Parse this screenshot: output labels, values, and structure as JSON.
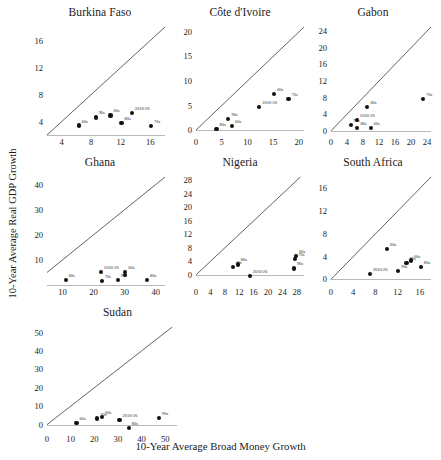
{
  "figure": {
    "ylabel": "10-Year Average Real GDP Growth",
    "xlabel": "10-Year Average Broad Money Growth",
    "point_color": "#111111",
    "line_color": "#3a3a3a",
    "background": "#ffffff"
  },
  "chart_data": {
    "type": "scatter",
    "title": "",
    "xlabel": "10-Year Average Broad Money Growth",
    "ylabel": "10-Year Average Real GDP Growth",
    "grid": false,
    "legend": false,
    "note": "Seven small-multiple scatter panels; each point is a decade. Diagonal reference line is the 45-degree line y = x.",
    "panels": [
      {
        "name": "Burkina Faso",
        "xlim": [
          2,
          18
        ],
        "ylim": [
          2,
          18
        ],
        "xticks": [
          4,
          8,
          12,
          16
        ],
        "yticks": [
          4,
          8,
          12,
          16
        ],
        "reference_line": "45-degree",
        "points": [
          {
            "label": "60s",
            "x": 6.3,
            "y": 3.4
          },
          {
            "label": "90s",
            "x": 8.6,
            "y": 4.6
          },
          {
            "label": "00s",
            "x": 10.6,
            "y": 4.9
          },
          {
            "label": "80s",
            "x": 12.1,
            "y": 3.8
          },
          {
            "label": "2010-20",
            "x": 13.5,
            "y": 5.2
          },
          {
            "label": "70s",
            "x": 16.1,
            "y": 3.3
          }
        ]
      },
      {
        "name": "Côte d'Ivoire",
        "xlim": [
          0,
          21
        ],
        "ylim": [
          -1,
          21
        ],
        "xticks": [
          0,
          5,
          10,
          15,
          20
        ],
        "yticks": [
          0,
          5,
          10,
          15,
          20
        ],
        "reference_line": "45-degree",
        "points": [
          {
            "label": "80s",
            "x": 4.0,
            "y": 0.2
          },
          {
            "label": "90s",
            "x": 6.3,
            "y": 2.3
          },
          {
            "label": "00s",
            "x": 7.0,
            "y": 0.8
          },
          {
            "label": "2010-20",
            "x": 12.3,
            "y": 4.7
          },
          {
            "label": "60s",
            "x": 15.2,
            "y": 7.4
          },
          {
            "label": "70s",
            "x": 18.0,
            "y": 6.3
          }
        ]
      },
      {
        "name": "Gabon",
        "xlim": [
          0,
          25
        ],
        "ylim": [
          -1,
          25
        ],
        "xticks": [
          0,
          4,
          8,
          12,
          16,
          20,
          24
        ],
        "yticks": [
          0,
          4,
          8,
          12,
          16,
          20,
          24
        ],
        "reference_line": "45-degree",
        "points": [
          {
            "label": "90s",
            "x": 4.9,
            "y": 1.4
          },
          {
            "label": "2010-20",
            "x": 6.5,
            "y": 2.7
          },
          {
            "label": "80s",
            "x": 6.6,
            "y": 0.7
          },
          {
            "label": "00s",
            "x": 9.9,
            "y": 0.6
          },
          {
            "label": "60s",
            "x": 9.1,
            "y": 5.8
          },
          {
            "label": "70s",
            "x": 23.0,
            "y": 7.7
          }
        ]
      },
      {
        "name": "Ghana",
        "xlim": [
          5,
          43
        ],
        "ylim": [
          0,
          43
        ],
        "xticks": [
          10,
          20,
          30,
          40
        ],
        "yticks": [
          10,
          20,
          30,
          40
        ],
        "reference_line": "45-degree",
        "points": [
          {
            "label": "60s",
            "x": 11.0,
            "y": 2.0
          },
          {
            "label": "70s",
            "x": 22.6,
            "y": 1.7
          },
          {
            "label": "2010-20",
            "x": 22.4,
            "y": 5.2
          },
          {
            "label": "90s",
            "x": 27.8,
            "y": 1.9
          },
          {
            "label": "00s",
            "x": 30.2,
            "y": 5.1
          },
          {
            "label": "00s-b",
            "x": 30.2,
            "y": 4.0
          },
          {
            "label": "80s",
            "x": 37.2,
            "y": 2.0
          }
        ]
      },
      {
        "name": "Nigeria",
        "xlim": [
          0,
          30
        ],
        "ylim": [
          -3,
          29
        ],
        "xticks": [
          0,
          4,
          8,
          12,
          16,
          20,
          24,
          28
        ],
        "yticks": [
          0,
          4,
          8,
          12,
          16,
          20,
          24,
          28
        ],
        "reference_line": "45-degree",
        "points": [
          {
            "label": "40s",
            "x": 10.2,
            "y": 2.4
          },
          {
            "label": "80s",
            "x": 11.6,
            "y": 3.1
          },
          {
            "label": "2010-20",
            "x": 14.9,
            "y": -0.4
          },
          {
            "label": "90s",
            "x": 27.2,
            "y": 1.9
          },
          {
            "label": "70s",
            "x": 27.6,
            "y": 4.6
          },
          {
            "label": "00s",
            "x": 27.8,
            "y": 5.6
          }
        ]
      },
      {
        "name": "South Africa",
        "xlim": [
          0,
          18
        ],
        "ylim": [
          -1,
          18
        ],
        "xticks": [
          0,
          4,
          8,
          12,
          16
        ],
        "yticks": [
          0,
          4,
          8,
          12,
          16
        ],
        "reference_line": "45-degree",
        "points": [
          {
            "label": "2010-20",
            "x": 7.0,
            "y": 1.0
          },
          {
            "label": "60s",
            "x": 10.1,
            "y": 5.4
          },
          {
            "label": "90s",
            "x": 12.1,
            "y": 1.4
          },
          {
            "label": "70s",
            "x": 13.6,
            "y": 2.9
          },
          {
            "label": "00s",
            "x": 14.4,
            "y": 3.3
          },
          {
            "label": "80s",
            "x": 16.2,
            "y": 2.1
          }
        ]
      },
      {
        "name": "Sudan",
        "xlim": [
          0,
          55
        ],
        "ylim": [
          -4,
          53
        ],
        "xticks": [
          0,
          10,
          20,
          30,
          40,
          50
        ],
        "yticks": [
          0,
          10,
          20,
          30,
          40,
          50
        ],
        "reference_line": "45-degree",
        "points": [
          {
            "label": "60s",
            "x": 12.5,
            "y": 1.0
          },
          {
            "label": "70s",
            "x": 21.3,
            "y": 3.3
          },
          {
            "label": "00s",
            "x": 23.3,
            "y": 4.2
          },
          {
            "label": "2010-20",
            "x": 30.7,
            "y": 2.7
          },
          {
            "label": "80s",
            "x": 34.6,
            "y": -1.8
          },
          {
            "label": "90s",
            "x": 47.4,
            "y": 3.7
          }
        ]
      }
    ]
  }
}
